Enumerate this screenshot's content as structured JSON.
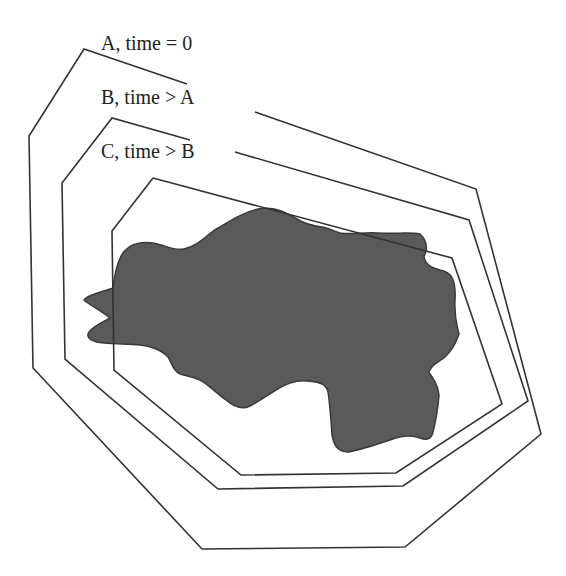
{
  "diagram": {
    "type": "nested-boundary-growth",
    "colors": {
      "background": "#ffffff",
      "line": "#333333",
      "blob_fill": "#5a5a5a",
      "blob_stroke": "#3a3a3a",
      "text": "#222222"
    },
    "labels": [
      {
        "id": "A",
        "text": "A, time = 0",
        "x": 101,
        "y": 33
      },
      {
        "id": "B",
        "text": "B, time > A",
        "x": 101,
        "y": 87
      },
      {
        "id": "C",
        "text": "C, time > B",
        "x": 101,
        "y": 141
      }
    ],
    "polygons": [
      {
        "id": "A",
        "segments": [
          [
            [
              187,
              84
            ],
            [
              84,
              49
            ],
            [
              29,
              136
            ],
            [
              33,
              368
            ],
            [
              202,
              549
            ],
            [
              405,
              547
            ],
            [
              541,
              434
            ],
            [
              476,
              189
            ],
            [
              255,
              112
            ]
          ]
        ]
      },
      {
        "id": "B",
        "segments": [
          [
            [
              190,
              140
            ],
            [
              112,
              118
            ],
            [
              62,
              183
            ],
            [
              65,
              359
            ],
            [
              218,
              489
            ],
            [
              403,
              486
            ],
            [
              528,
              401
            ],
            [
              469,
              220
            ],
            [
              235,
              152
            ]
          ]
        ]
      },
      {
        "id": "C",
        "segments": [
          [
            [
              153,
              178
            ],
            [
              112,
              231
            ],
            [
              114,
              370
            ],
            [
              241,
              475
            ],
            [
              396,
              473
            ],
            [
              502,
              404
            ],
            [
              452,
              258
            ],
            [
              153,
              178
            ]
          ]
        ]
      }
    ],
    "region": {
      "name": "shaded-region",
      "path": "M 113 288 C 116 262, 122 245, 140 243 C 160 240, 170 252, 184 249 C 198 246, 205 236, 218 228 C 235 218, 245 212, 258 209 C 275 206, 285 212, 295 218 C 305 224, 312 226, 322 227 C 330 228, 333 231, 340 233 C 352 235, 362 232, 378 233 C 395 234, 410 232, 420 234 C 427 240, 428 250, 424 256 C 425 265, 432 268, 440 270 C 452 272, 456 280, 455 300 C 454 318, 457 326, 459 334 C 456 343, 452 350, 446 356 C 440 362, 431 364, 429 372 C 433 379, 438 384, 439 395 C 438 410, 436 420, 433 432 C 432 438, 428 441, 420 438 C 410 434, 400 436, 390 440 C 375 445, 360 450, 348 452 C 338 452, 334 446, 332 435 C 331 420, 330 405, 328 392 C 326 383, 318 382, 307 381 C 295 380, 286 384, 276 390 C 265 397, 258 402, 250 406 C 242 410, 234 407, 226 400 C 215 392, 208 384, 200 380 C 192 376, 186 376, 180 374 C 174 372, 172 364, 168 357 C 162 350, 150 346, 140 345 C 128 344, 118 344, 104 343 C 92 342, 85 338, 89 332 C 93 326, 103 322, 110 318 C 100 310, 88 304, 84 300 C 86 296, 98 293, 113 288 Z"
    }
  }
}
